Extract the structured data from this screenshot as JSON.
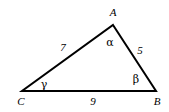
{
  "figure": {
    "type": "triangle-diagram",
    "background_color": "#ffffff",
    "stroke_color": "#000000",
    "stroke_width": 2,
    "vertices": [
      {
        "name": "A",
        "label": "A",
        "x": 113,
        "y": 25,
        "label_x": 113,
        "label_y": 12
      },
      {
        "name": "B",
        "label": "B",
        "x": 156,
        "y": 91,
        "label_x": 157,
        "label_y": 101
      },
      {
        "name": "C",
        "label": "C",
        "x": 22,
        "y": 91,
        "label_x": 21,
        "label_y": 101
      }
    ],
    "sides": [
      {
        "name": "side-CA",
        "label": "7",
        "x": 63,
        "y": 47
      },
      {
        "name": "side-AB",
        "label": "5",
        "x": 140,
        "y": 50
      },
      {
        "name": "side-CB",
        "label": "9",
        "x": 93,
        "y": 101
      }
    ],
    "angles": [
      {
        "name": "angle-A",
        "label": "α",
        "x": 110,
        "y": 42
      },
      {
        "name": "angle-B",
        "label": "β",
        "x": 136,
        "y": 79
      },
      {
        "name": "angle-C",
        "label": "γ",
        "x": 44,
        "y": 84
      }
    ]
  }
}
